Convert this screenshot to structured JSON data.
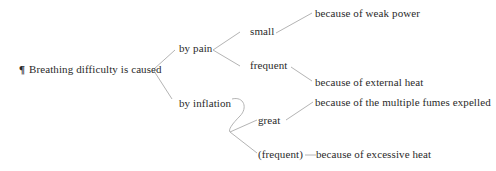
{
  "diagram": {
    "type": "bracket-tree",
    "line_color": "#b4b4b4",
    "text_color": "#2a2a2a",
    "root": {
      "marker": "¶",
      "label": "Breathing difficulty is caused"
    },
    "branches": [
      {
        "label": "by pain",
        "children": [
          {
            "label": "small",
            "cause": "because of weak power"
          },
          {
            "label": "frequent",
            "cause": "because of external heat"
          }
        ]
      },
      {
        "label": "by inflation",
        "children": [
          {
            "label": "great",
            "cause": "because of the multiple fumes expelled"
          },
          {
            "label": "(frequent)",
            "cause": "because of excessive heat"
          }
        ]
      }
    ]
  }
}
